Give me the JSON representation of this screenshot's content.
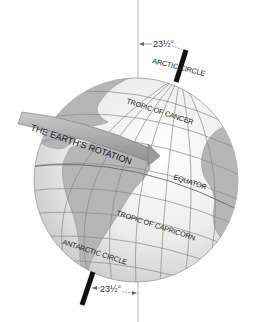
{
  "diagram": {
    "tilt_top_label": "23½°",
    "tilt_bottom_label": "23½°",
    "rotation_band_label": "THE EARTH'S ROTATION",
    "latitude_labels": {
      "arctic": "ARCTIC CIRCLE",
      "cancer": "TROPIC OF CANCER",
      "equator": "EQUATOR",
      "capricorn": "TROPIC OF CAPRICORN",
      "antarctic": "ANTARCTIC CIRCLE"
    },
    "colors": {
      "ocean": "#f2f2f2",
      "land": "#b8b8b8",
      "grid": "#8a8a8a",
      "axis": "#111111",
      "band": "#a9a9a9",
      "vertical_line": "#9a9a9a"
    }
  }
}
